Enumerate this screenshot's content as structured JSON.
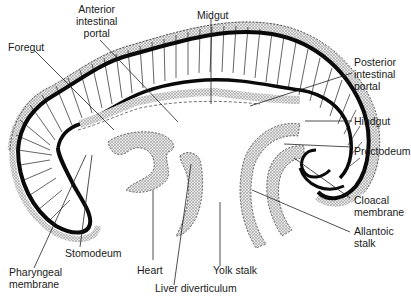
{
  "figure": {
    "colors": {
      "ink": "#111111",
      "stipple": "#bdbdbd",
      "background": "#ffffff"
    }
  },
  "labels": {
    "foregut": "Foregut",
    "anterior_intestinal_portal": [
      "Anterior",
      "intestinal",
      "portal"
    ],
    "midgut": "Midgut",
    "posterior_intestinal_portal": [
      "Posterior",
      "intestinal",
      "portal"
    ],
    "hindgut": "Hindgut",
    "proctodeum": "Proctodeum",
    "cloacal_membrane": [
      "Cloacal",
      "membrane"
    ],
    "allantoic_stalk": [
      "Allantoic",
      "stalk"
    ],
    "yolk_stalk": "Yolk stalk",
    "liver_diverticulum": "Liver diverticulum",
    "heart": "Heart",
    "stomodeum": "Stomodeum",
    "pharyngeal_membrane": [
      "Pharyngeal",
      "membrane"
    ]
  }
}
